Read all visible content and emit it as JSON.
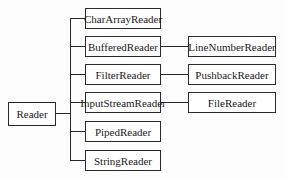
{
  "diagram": {
    "type": "class-hierarchy-tree",
    "root": {
      "label": "Reader"
    },
    "children": [
      {
        "label": "CharArrayReader",
        "subclass": null
      },
      {
        "label": "BufferedReader",
        "subclass": "LineNumberReader"
      },
      {
        "label": "FilterReader",
        "subclass": "PushbackReader"
      },
      {
        "label": "InputStreamReader",
        "subclass": "FileReader"
      },
      {
        "label": "PipedReader",
        "subclass": null
      },
      {
        "label": "StringReader",
        "subclass": null
      }
    ]
  },
  "nodes": {
    "reader": "Reader",
    "char_array_reader": "CharArrayReader",
    "buffered_reader": "BufferedReader",
    "filter_reader": "FilterReader",
    "input_stream_reader": "InputStreamReader",
    "piped_reader": "PipedReader",
    "string_reader": "StringReader",
    "line_number_reader": "LineNumberReader",
    "pushback_reader": "PushbackReader",
    "file_reader": "FileReader"
  }
}
